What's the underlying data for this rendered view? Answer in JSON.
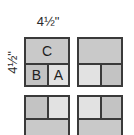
{
  "diagram": {
    "dimension_width": "4½\"",
    "dimension_height": "4½\"",
    "colors": {
      "C": "#c9c9c9",
      "B": "#c3c3c3",
      "A": "#e2e2e2",
      "border": "#3a3a3a"
    },
    "blocks": [
      {
        "position": "top-left",
        "cells": {
          "full": "C",
          "left": "B",
          "right": "A"
        },
        "full_on_top": true
      },
      {
        "position": "top-right",
        "cells": {
          "full": "",
          "left": "",
          "right": ""
        },
        "full_on_top": true
      },
      {
        "position": "bottom-left",
        "cells": {
          "full": "",
          "left": "",
          "right": ""
        },
        "full_on_top": false
      },
      {
        "position": "bottom-right",
        "cells": {
          "full": "",
          "left": "",
          "right": ""
        },
        "full_on_top": false
      }
    ]
  }
}
